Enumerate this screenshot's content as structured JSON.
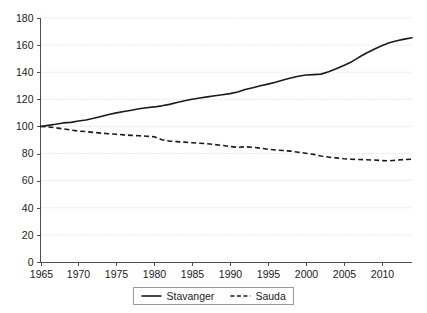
{
  "chart_data": {
    "type": "line",
    "title": "",
    "subtitle": "",
    "xlabel": "",
    "ylabel": "",
    "xlim": [
      1965,
      2014
    ],
    "ylim": [
      0,
      180
    ],
    "grid": true,
    "legend_position": "bottom-center",
    "y_ticks": [
      0,
      20,
      40,
      60,
      80,
      100,
      120,
      140,
      160,
      180
    ],
    "y_tick_labels": [
      "0",
      "20",
      "40",
      "60",
      "80",
      "100",
      "120",
      "140",
      "160",
      "180"
    ],
    "x_ticks": [
      1965,
      1970,
      1975,
      1980,
      1985,
      1990,
      1995,
      2000,
      2005,
      2010
    ],
    "x_tick_labels": [
      "1965",
      "1970",
      "1975",
      "1980",
      "1985",
      "1990",
      "1995",
      "2000",
      "2005",
      "2010"
    ],
    "x": [
      1965,
      1966,
      1967,
      1968,
      1969,
      1970,
      1971,
      1972,
      1973,
      1974,
      1975,
      1976,
      1977,
      1978,
      1979,
      1980,
      1981,
      1982,
      1983,
      1984,
      1985,
      1986,
      1987,
      1988,
      1989,
      1990,
      1991,
      1992,
      1993,
      1994,
      1995,
      1996,
      1997,
      1998,
      1999,
      2000,
      2001,
      2002,
      2003,
      2004,
      2005,
      2006,
      2007,
      2008,
      2009,
      2010,
      2011,
      2012,
      2013,
      2014
    ],
    "series": [
      {
        "name": "Stavanger",
        "style": "solid",
        "color": "#1a1a1a",
        "values": [
          100.0,
          100.8,
          101.6,
          102.6,
          103.0,
          104.0,
          104.8,
          106.0,
          107.4,
          108.8,
          110.0,
          111.0,
          112.0,
          113.0,
          113.8,
          114.4,
          115.2,
          116.3,
          117.6,
          118.9,
          120.1,
          121.0,
          121.8,
          122.6,
          123.4,
          124.2,
          125.4,
          127.2,
          128.6,
          130.0,
          131.2,
          132.6,
          134.2,
          135.8,
          137.0,
          137.9,
          138.2,
          138.6,
          140.4,
          142.6,
          145.0,
          147.6,
          151.0,
          154.2,
          157.0,
          159.6,
          161.8,
          163.2,
          164.4,
          165.4
        ]
      },
      {
        "name": "Sauda",
        "style": "dashed",
        "color": "#1a1a1a",
        "values": [
          100.0,
          99.6,
          99.0,
          98.2,
          97.4,
          96.6,
          96.2,
          95.6,
          95.1,
          94.6,
          94.2,
          93.8,
          93.4,
          93.1,
          92.8,
          92.4,
          90.2,
          89.2,
          88.8,
          88.4,
          88.0,
          87.6,
          87.2,
          86.6,
          86.0,
          85.2,
          84.6,
          85.0,
          84.6,
          84.0,
          83.2,
          82.6,
          82.2,
          81.8,
          81.0,
          80.2,
          79.4,
          78.2,
          77.4,
          76.8,
          76.2,
          75.8,
          75.6,
          75.4,
          75.2,
          74.8,
          74.6,
          75.2,
          75.6,
          75.8
        ]
      }
    ],
    "legend": [
      {
        "label": "Stavanger",
        "style": "solid"
      },
      {
        "label": "Sauda",
        "style": "dashed"
      }
    ]
  }
}
